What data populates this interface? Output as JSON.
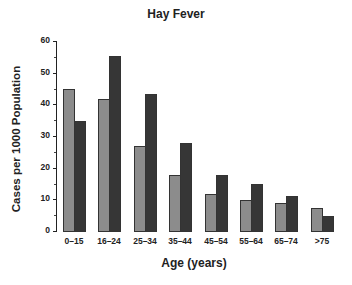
{
  "chart_data": {
    "type": "bar",
    "title": "Hay Fever",
    "xlabel": "Age (years)",
    "ylabel": "Cases per 1000 Population",
    "categories": [
      "0–15",
      "16–24",
      "25–34",
      "35–44",
      "45–54",
      "55–64",
      "65–74",
      ">75"
    ],
    "series": [
      {
        "name": "Series 1 (light gray)",
        "color": "#8c8c8c",
        "values": [
          45,
          42,
          27,
          18,
          12,
          10,
          9,
          7.5
        ]
      },
      {
        "name": "Series 2 (dark gray)",
        "color": "#363636",
        "values": [
          35,
          55.5,
          43.5,
          28,
          18,
          15,
          11.5,
          5
        ]
      }
    ],
    "ylim": [
      0,
      60
    ],
    "yticks": [
      0,
      10,
      20,
      30,
      40,
      50,
      60
    ],
    "grid": false,
    "legend": null
  }
}
